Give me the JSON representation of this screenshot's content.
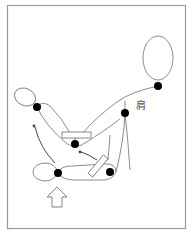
{
  "diagram": {
    "title": "",
    "labels": {
      "shoulder": "肩"
    },
    "colors": {
      "frame": "#9a9a9a",
      "line": "#6e6e6e",
      "joint": "#000000",
      "background": "#ffffff"
    },
    "nodes": [
      {
        "id": "neck",
        "x": 158,
        "y": 86
      },
      {
        "id": "shoulder",
        "x": 125,
        "y": 113
      },
      {
        "id": "upper-wrist",
        "x": 37,
        "y": 107
      },
      {
        "id": "upper-elbow",
        "x": 75,
        "y": 144
      },
      {
        "id": "lower-wrist",
        "x": 58,
        "y": 173
      },
      {
        "id": "lower-elbow",
        "x": 110,
        "y": 172
      }
    ]
  }
}
